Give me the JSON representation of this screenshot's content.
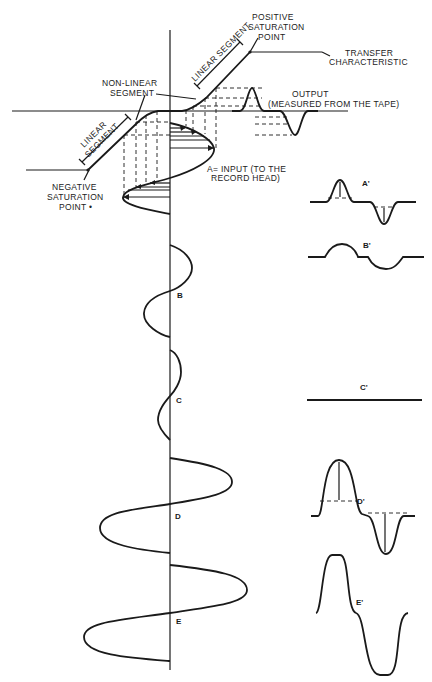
{
  "diagram": {
    "labels": {
      "positive_saturation": [
        "POSITIVE",
        "SATURATION",
        "POINT"
      ],
      "transfer_characteristic": [
        "TRANSFER",
        "CHARACTERISTIC"
      ],
      "non_linear_segment": [
        "NON-LINEAR",
        "SEGMENT"
      ],
      "linear_segment_upper": "LINEAR SEGMENT",
      "linear_segment_lower": [
        "LINEAR",
        "SEGMENT"
      ],
      "output": [
        "OUTPUT",
        "(MEASURED FROM THE TAPE)"
      ],
      "negative_saturation": [
        "NEGATIVE",
        "SATURATION",
        "POINT •"
      ],
      "input": [
        "A= INPUT  (TO THE",
        "RECORD HEAD)"
      ]
    },
    "inputs": [
      {
        "id": "A",
        "label": "A"
      },
      {
        "id": "B",
        "label": "B"
      },
      {
        "id": "C",
        "label": "C"
      },
      {
        "id": "D",
        "label": "D"
      },
      {
        "id": "E",
        "label": "E"
      }
    ],
    "outputs": [
      {
        "id": "A'",
        "label": "A'"
      },
      {
        "id": "B'",
        "label": "B'"
      },
      {
        "id": "C'",
        "label": "C'"
      },
      {
        "id": "D'",
        "label": "D'"
      },
      {
        "id": "E'",
        "label": "E'"
      }
    ]
  }
}
